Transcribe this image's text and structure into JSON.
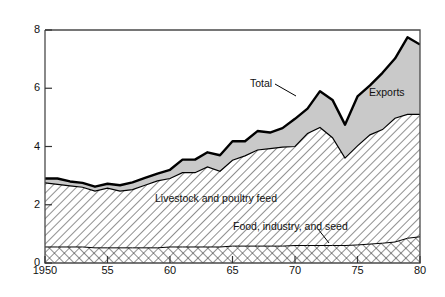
{
  "axis_unit_label": "Bil. bu.",
  "x_title": "Year Beginning Oct. 1",
  "labels": {
    "total": "Total",
    "exports": "Exports",
    "feed": "Livestock and poultry feed",
    "food": "Food, industry, and seed"
  },
  "ticks": {
    "y": [
      "0",
      "2",
      "4",
      "6",
      "8"
    ],
    "x": [
      "1950",
      "55",
      "60",
      "65",
      "70",
      "75",
      "80"
    ]
  },
  "colors": {
    "line": "#000000",
    "exports_fill": "#c9c9c9",
    "feed_fill": "#ffffff",
    "food_fill": "#ffffff",
    "frame": "#4a4a4a",
    "background": "#ffffff"
  },
  "chart_data": {
    "type": "area",
    "stacked": true,
    "title": "",
    "xlabel": "Year Beginning Oct. 1",
    "ylabel": "Bil. bu.",
    "ylim": [
      0,
      8
    ],
    "xlim": [
      1950,
      1980
    ],
    "grid": false,
    "legend": "in-plot annotations",
    "x": [
      1950,
      1951,
      1952,
      1953,
      1954,
      1955,
      1956,
      1957,
      1958,
      1959,
      1960,
      1961,
      1962,
      1963,
      1964,
      1965,
      1966,
      1967,
      1968,
      1969,
      1970,
      1971,
      1972,
      1973,
      1974,
      1975,
      1976,
      1977,
      1978,
      1979,
      1980
    ],
    "series": [
      {
        "name": "Food, industry, and seed",
        "pattern": "cross-hatch",
        "values": [
          0.55,
          0.55,
          0.55,
          0.55,
          0.52,
          0.52,
          0.52,
          0.52,
          0.52,
          0.52,
          0.55,
          0.55,
          0.55,
          0.55,
          0.55,
          0.58,
          0.58,
          0.58,
          0.58,
          0.58,
          0.6,
          0.6,
          0.6,
          0.6,
          0.6,
          0.62,
          0.65,
          0.68,
          0.72,
          0.85,
          0.9
        ]
      },
      {
        "name": "Livestock and poultry feed",
        "pattern": "diagonal-hatch",
        "values": [
          2.2,
          2.15,
          2.1,
          2.05,
          1.95,
          2.05,
          1.95,
          2.0,
          2.15,
          2.3,
          2.35,
          2.55,
          2.55,
          2.75,
          2.6,
          2.95,
          3.1,
          3.3,
          3.35,
          3.4,
          3.4,
          3.85,
          4.05,
          3.7,
          3.0,
          3.4,
          3.75,
          3.9,
          4.25,
          4.25,
          4.2
        ]
      },
      {
        "name": "Exports",
        "pattern": "solid-gray",
        "values": [
          0.15,
          0.2,
          0.15,
          0.15,
          0.15,
          0.15,
          0.2,
          0.25,
          0.25,
          0.25,
          0.3,
          0.45,
          0.45,
          0.5,
          0.55,
          0.65,
          0.5,
          0.65,
          0.55,
          0.65,
          0.95,
          0.85,
          1.25,
          1.3,
          1.15,
          1.7,
          1.7,
          1.95,
          2.05,
          2.65,
          2.4
        ]
      }
    ],
    "total_values": [
      2.9,
      2.9,
      2.8,
      2.75,
      2.62,
      2.72,
      2.67,
      2.77,
      2.92,
      3.07,
      3.2,
      3.55,
      3.55,
      3.8,
      3.7,
      4.18,
      4.18,
      4.53,
      4.48,
      4.63,
      4.95,
      5.3,
      5.9,
      5.6,
      4.75,
      5.72,
      6.1,
      6.53,
      7.02,
      7.75,
      7.5
    ],
    "annotations": [
      {
        "text": "Total",
        "x": 1966,
        "leader": true
      },
      {
        "text": "Exports",
        "x": 1975,
        "leader": false
      },
      {
        "text": "Livestock and poultry feed",
        "x": 1960,
        "leader": false
      },
      {
        "text": "Food, industry, and seed",
        "x": 1969,
        "leader": true
      }
    ]
  }
}
